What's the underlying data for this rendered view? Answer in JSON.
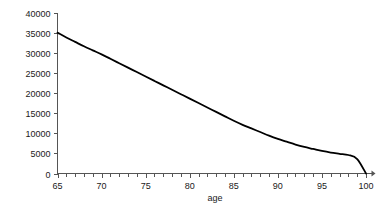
{
  "chart_data": {
    "type": "line",
    "title": "",
    "subtitle": "",
    "xlabel": "age",
    "ylabel": "",
    "xlim": [
      65,
      100
    ],
    "ylim": [
      0,
      40000
    ],
    "grid": false,
    "legend": "none",
    "x_ticks": [
      65,
      70,
      75,
      80,
      85,
      90,
      95,
      100
    ],
    "x_tick_labels": [
      "65",
      "70",
      "75",
      "80",
      "85",
      "90",
      "95",
      "100"
    ],
    "x_minor_tick_step": 1,
    "y_ticks": [
      0,
      5000,
      10000,
      15000,
      20000,
      25000,
      30000,
      35000,
      40000
    ],
    "y_tick_labels": [
      "0",
      "5000",
      "10000",
      "15000",
      "20000",
      "25000",
      "30000",
      "35000",
      "40000"
    ],
    "series": [
      {
        "name": "survivors",
        "color": "#000000",
        "x": [
          65,
          66,
          67,
          68,
          69,
          70,
          71,
          72,
          73,
          74,
          75,
          76,
          77,
          78,
          79,
          80,
          81,
          82,
          83,
          84,
          85,
          86,
          87,
          88,
          89,
          90,
          91,
          92,
          93,
          94,
          95,
          96,
          97,
          98,
          99,
          100
        ],
        "values": [
          35000,
          33800,
          32700,
          31600,
          30600,
          29600,
          28500,
          27400,
          26300,
          25200,
          24100,
          23000,
          21900,
          20800,
          19700,
          18600,
          17500,
          16400,
          15300,
          14200,
          13100,
          12100,
          11200,
          10300,
          9400,
          8600,
          7900,
          7200,
          6600,
          6100,
          5600,
          5200,
          4900,
          4600,
          3600,
          0
        ]
      }
    ]
  },
  "axis": {
    "x_title": "age"
  }
}
